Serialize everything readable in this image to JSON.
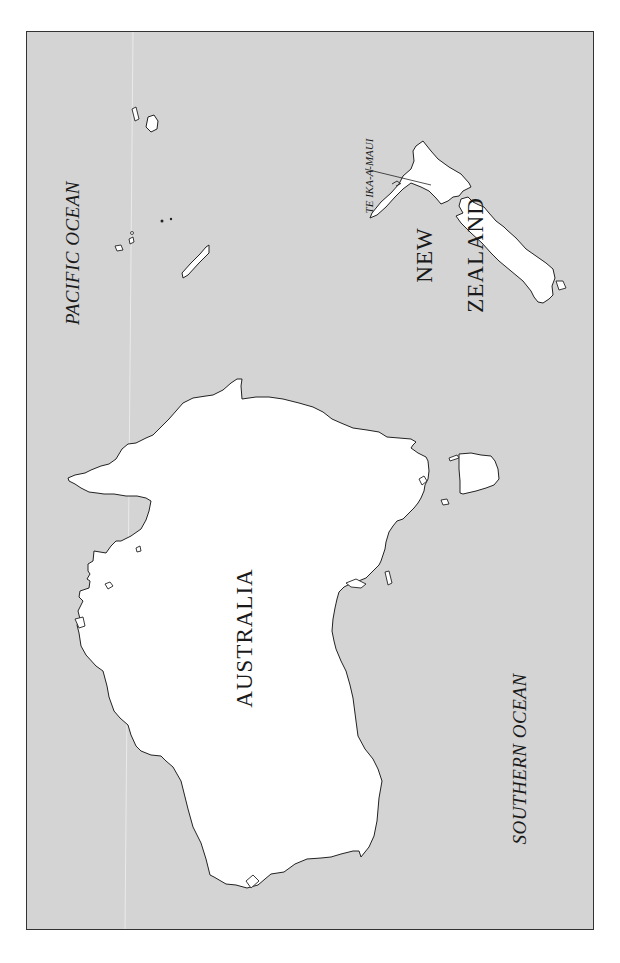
{
  "map": {
    "orientation": "rotated 90 degrees counter-clockwise (north at left)",
    "colors": {
      "ocean": "#d4d4d4",
      "land": "#ffffff",
      "coastline": "#222222",
      "frame": "#333333"
    },
    "labels": {
      "pacific_ocean": "PACIFIC OCEAN",
      "southern_ocean": "SOUTHERN OCEAN",
      "australia": "AUSTRALIA",
      "new_zealand_line1": "NEW",
      "new_zealand_line2": "ZEALAND",
      "te_ika_a_maui": "TE IKA-A-MAUI"
    },
    "features": [
      {
        "name": "Australia",
        "type": "landmass"
      },
      {
        "name": "Tasmania",
        "type": "island"
      },
      {
        "name": "New Zealand North Island (Te Ika-a-Maui)",
        "type": "island"
      },
      {
        "name": "New Zealand South Island",
        "type": "island"
      },
      {
        "name": "New Caledonia",
        "type": "island"
      },
      {
        "name": "Pacific islands",
        "type": "island-group"
      }
    ]
  }
}
